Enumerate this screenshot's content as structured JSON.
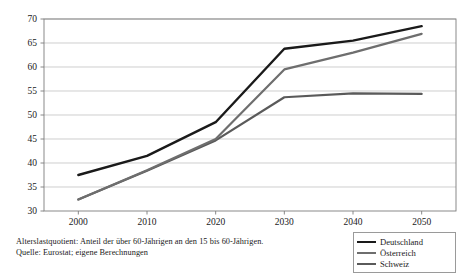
{
  "chart_data": {
    "type": "line",
    "title": "",
    "subtitle": "",
    "xlabel": "",
    "ylabel": "",
    "x": [
      2000,
      2010,
      2020,
      2030,
      2040,
      2050
    ],
    "categories": [
      "2000",
      "2010",
      "2020",
      "2030",
      "2040",
      "2050"
    ],
    "xlim": [
      1995,
      2055
    ],
    "ylim": [
      30,
      70
    ],
    "yticks": [
      30,
      35,
      40,
      45,
      50,
      55,
      60,
      65,
      70
    ],
    "ytick_labels": [
      "30",
      "35",
      "40",
      "45",
      "50",
      "55",
      "60",
      "65",
      "70"
    ],
    "xticks": [
      2000,
      2010,
      2020,
      2030,
      2040,
      2050
    ],
    "xtick_labels": [
      "2000",
      "2010",
      "2020",
      "2030",
      "2040",
      "2050"
    ],
    "grid": "horizontal",
    "legend_position": "bottom-right",
    "series": [
      {
        "name": "Deutschland",
        "color": "#1a1a1a",
        "width": 2.4,
        "values": [
          37.5,
          41.5,
          48.5,
          63.8,
          65.5,
          68.5
        ]
      },
      {
        "name": "Österreich",
        "color": "#6e6e6e",
        "width": 2.2,
        "values": [
          32.4,
          38.5,
          45.0,
          59.5,
          63.0,
          66.9
        ]
      },
      {
        "name": "Schweiz",
        "color": "#5a5a5a",
        "width": 2.2,
        "values": [
          32.4,
          38.4,
          44.7,
          53.7,
          54.5,
          54.4
        ]
      }
    ]
  },
  "legend": {
    "items": [
      {
        "label": "Deutschland",
        "color": "#1a1a1a"
      },
      {
        "label": "Österreich",
        "color": "#6e6e6e"
      },
      {
        "label": "Schweiz",
        "color": "#5a5a5a"
      }
    ]
  },
  "caption": {
    "line1": "Alterslastquotient: Anteil der über 60-Jährigen an den 15 bis 60-Jährigen.",
    "line2": "Quelle: Eurostat; eigene Berechnungen"
  },
  "axes": {
    "plot_left": 44,
    "plot_right": 456,
    "plot_top": 19,
    "plot_bottom": 211
  }
}
